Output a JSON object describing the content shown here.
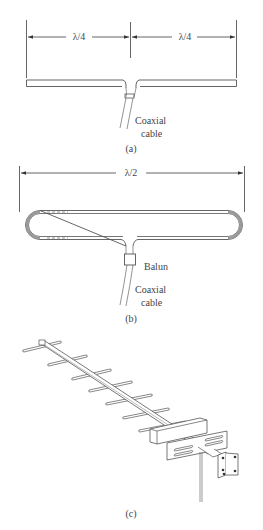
{
  "figure": {
    "panel_a": {
      "caption": "(a)",
      "title": "Half-wave dipole",
      "dimension_left": "λ/4",
      "dimension_right": "λ/4",
      "cable_label_line1": "Coaxial",
      "cable_label_line2": "cable"
    },
    "panel_b": {
      "caption": "(b)",
      "title": "Folded dipole",
      "dimension": "λ/2",
      "balun_label": "Balun",
      "cable_label_line1": "Coaxial",
      "cable_label_line2": "cable"
    },
    "panel_c": {
      "caption": "(c)",
      "title": "Yagi antenna",
      "element_count": 9
    },
    "colors": {
      "line": "#555555",
      "text": "#444444",
      "shade": "#9a9a9a",
      "background": "#ffffff"
    }
  }
}
